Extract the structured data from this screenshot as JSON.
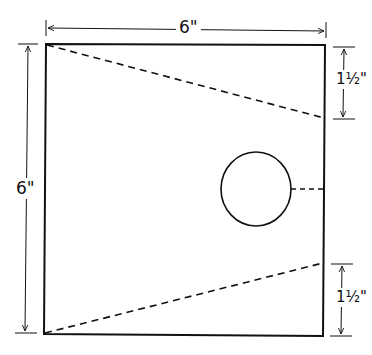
{
  "diagram": {
    "type": "dimensioned-template-drawing",
    "square": {
      "label_width": "6\"",
      "label_height": "6\"",
      "stroke": "#111111"
    },
    "dimensions": {
      "top_width": "6\"",
      "left_height": "6\"",
      "right_upper": "1½\"",
      "right_lower": "1½\""
    },
    "elements": [
      {
        "name": "square-outline",
        "shape": "rectangle"
      },
      {
        "name": "upper-fold-line",
        "style": "dashed",
        "from": "top-left corner",
        "to": "right edge 1½\" down"
      },
      {
        "name": "lower-fold-line",
        "style": "dashed",
        "from": "bottom-left corner",
        "to": "right edge 1½\" up"
      },
      {
        "name": "circle-hole",
        "shape": "circle"
      },
      {
        "name": "circle-cut-line",
        "style": "dashed",
        "from": "circle",
        "to": "right edge"
      }
    ],
    "colors": {
      "line": "#111111",
      "background": "#ffffff"
    }
  }
}
